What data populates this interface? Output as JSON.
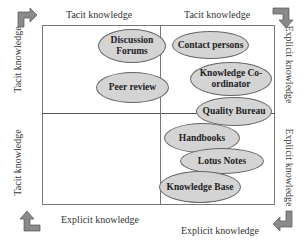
{
  "diagram": {
    "type": "2x2 knowledge matrix",
    "axis_labels": {
      "top_left": "Tacit knowledge",
      "top_right": "Tacit knowledge",
      "bottom_left": "Explicit knowledge",
      "bottom_right": "Explicit knowledge",
      "left_upper": "Tacit knowledge",
      "left_lower": "Tacit knowledge",
      "right_upper": "Explicit knowledge",
      "right_lower": "Explicit knowledge"
    },
    "nodes": [
      {
        "id": "discussion-forums",
        "label": "Discussion Forums"
      },
      {
        "id": "contact-persons",
        "label": "Contact persons"
      },
      {
        "id": "knowledge-coordinator",
        "label": "Knowledge Co-ordinator"
      },
      {
        "id": "peer-review",
        "label": "Peer review"
      },
      {
        "id": "quality-bureau",
        "label": "Quality Bureau"
      },
      {
        "id": "handbooks",
        "label": "Handbooks"
      },
      {
        "id": "lotus-notes",
        "label": "Lotus Notes"
      },
      {
        "id": "knowledge-base",
        "label": "Knowledge Base"
      }
    ],
    "corner_arrows": [
      {
        "position": "top-left",
        "direction": "right"
      },
      {
        "position": "top-right",
        "direction": "down"
      },
      {
        "position": "bottom-right",
        "direction": "left"
      },
      {
        "position": "bottom-left",
        "direction": "up"
      }
    ],
    "colors": {
      "ellipse_fill": "#d4d4d4",
      "ellipse_border": "#666666",
      "arrow_fill": "#8a8a8a",
      "frame": "#777777"
    }
  }
}
